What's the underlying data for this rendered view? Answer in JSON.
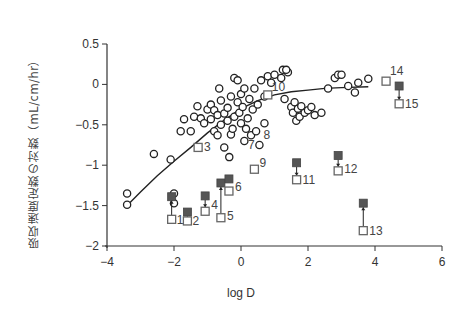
{
  "chart_data": {
    "type": "scatter",
    "title": "",
    "xlabel": "log D",
    "ylabel": "吸収速度定数の対数（mL/cm/hr）",
    "xlim": [
      -4,
      6
    ],
    "ylim": [
      -2,
      0.5
    ],
    "xticks": [
      "−4",
      "−2",
      "0",
      "2",
      "4",
      "6"
    ],
    "xtick_values": [
      -4,
      -2,
      0,
      2,
      4,
      6
    ],
    "yticks": [
      "0.5",
      "0",
      "−0.5",
      "−1",
      "−1.5",
      "−2"
    ],
    "ytick_values": [
      0.5,
      0,
      -0.5,
      -1,
      -1.5,
      -2
    ],
    "grid": false,
    "legend": null,
    "series": [
      {
        "name": "fitted curve",
        "style": "line",
        "points": [
          [
            -3.4,
            -1.5
          ],
          [
            -3.0,
            -1.33
          ],
          [
            -2.5,
            -1.13
          ],
          [
            -2.0,
            -0.95
          ],
          [
            -1.5,
            -0.78
          ],
          [
            -1.0,
            -0.6
          ],
          [
            -0.5,
            -0.44
          ],
          [
            0.0,
            -0.3
          ],
          [
            0.5,
            -0.2
          ],
          [
            1.0,
            -0.13
          ],
          [
            1.5,
            -0.09
          ],
          [
            2.0,
            -0.07
          ],
          [
            2.5,
            -0.05
          ],
          [
            3.0,
            -0.04
          ],
          [
            3.8,
            -0.03
          ]
        ]
      },
      {
        "name": "reference compounds",
        "style": "open-circle",
        "points": [
          [
            -3.4,
            -1.35
          ],
          [
            -3.4,
            -1.49
          ],
          [
            -2.6,
            -0.86
          ],
          [
            -2.1,
            -0.93
          ],
          [
            -1.8,
            -0.58
          ],
          [
            -1.7,
            -0.43
          ],
          [
            -1.5,
            -0.58
          ],
          [
            -1.4,
            -0.4
          ],
          [
            -1.3,
            -0.27
          ],
          [
            -1.2,
            -0.42
          ],
          [
            -1.1,
            -0.48
          ],
          [
            -1.0,
            -0.31
          ],
          [
            -0.9,
            -0.43
          ],
          [
            -0.9,
            -0.25
          ],
          [
            -0.8,
            -0.32
          ],
          [
            -0.8,
            -0.58
          ],
          [
            -0.7,
            -0.63
          ],
          [
            -0.7,
            -0.38
          ],
          [
            -0.6,
            -0.2
          ],
          [
            -0.6,
            -0.5
          ],
          [
            -0.5,
            -0.36
          ],
          [
            -0.5,
            -0.78
          ],
          [
            -0.4,
            -0.45
          ],
          [
            -0.4,
            -0.29
          ],
          [
            -0.3,
            -0.62
          ],
          [
            -0.3,
            -0.15
          ],
          [
            -0.25,
            -0.55
          ],
          [
            -0.2,
            -0.4
          ],
          [
            -0.2,
            0.08
          ],
          [
            -0.1,
            0.05
          ],
          [
            -0.1,
            -0.22
          ],
          [
            -0.05,
            -0.35
          ],
          [
            0.0,
            -0.48
          ],
          [
            0.0,
            -0.12
          ],
          [
            0.05,
            -0.28
          ],
          [
            0.1,
            -0.7
          ],
          [
            0.15,
            -0.55
          ],
          [
            0.2,
            -0.42
          ],
          [
            0.25,
            -0.18
          ],
          [
            0.3,
            -0.63
          ],
          [
            0.35,
            -0.31
          ],
          [
            0.4,
            -0.05
          ],
          [
            0.45,
            -0.58
          ],
          [
            0.5,
            -0.25
          ],
          [
            0.55,
            -0.75
          ],
          [
            0.6,
            0.05
          ],
          [
            0.7,
            -0.48
          ],
          [
            0.8,
            0.1
          ],
          [
            0.9,
            0.02
          ],
          [
            1.0,
            0.12
          ],
          [
            1.2,
            0.08
          ],
          [
            1.3,
            -0.18
          ],
          [
            1.4,
            0.15
          ],
          [
            1.5,
            -0.28
          ],
          [
            1.55,
            -0.35
          ],
          [
            1.6,
            -0.22
          ],
          [
            1.65,
            -0.45
          ],
          [
            1.7,
            -0.3
          ],
          [
            1.75,
            -0.4
          ],
          [
            1.8,
            -0.27
          ],
          [
            1.9,
            -0.35
          ],
          [
            2.0,
            -0.32
          ],
          [
            2.1,
            -0.28
          ],
          [
            2.2,
            -0.38
          ],
          [
            2.4,
            -0.35
          ],
          [
            2.6,
            -0.05
          ],
          [
            2.8,
            0.08
          ],
          [
            2.9,
            0.12
          ],
          [
            3.0,
            0.12
          ],
          [
            3.2,
            -0.02
          ],
          [
            3.4,
            -0.1
          ],
          [
            3.5,
            0.02
          ],
          [
            3.8,
            0.07
          ],
          [
            -0.35,
            -0.9
          ],
          [
            0.1,
            -0.05
          ],
          [
            -0.65,
            -0.05
          ],
          [
            0.7,
            -0.15
          ],
          [
            1.25,
            0.18
          ],
          [
            1.35,
            0.18
          ],
          [
            -2.0,
            -1.35
          ],
          [
            -2.0,
            -1.47
          ]
        ]
      },
      {
        "name": "test compounds (open = without enhancer)",
        "style": "open-square",
        "points": [
          {
            "id": "1",
            "x": -2.07,
            "y": -1.67
          },
          {
            "id": "2",
            "x": -1.6,
            "y": -1.69
          },
          {
            "id": "3",
            "x": -1.28,
            "y": -0.78
          },
          {
            "id": "4",
            "x": -1.07,
            "y": -1.57
          },
          {
            "id": "5",
            "x": -0.6,
            "y": -1.65
          },
          {
            "id": "6",
            "x": -0.36,
            "y": -1.32
          },
          {
            "id": "9",
            "x": 0.4,
            "y": -1.05
          },
          {
            "id": "10",
            "x": 0.8,
            "y": -0.13
          },
          {
            "id": "11",
            "x": 1.66,
            "y": -1.18
          },
          {
            "id": "12",
            "x": 2.9,
            "y": -1.07
          },
          {
            "id": "13",
            "x": 3.65,
            "y": -1.81
          },
          {
            "id": "14",
            "x": 4.33,
            "y": 0.04
          },
          {
            "id": "15",
            "x": 4.72,
            "y": -0.24
          }
        ]
      },
      {
        "name": "test compounds (filled = with enhancer)",
        "style": "filled-square",
        "points": [
          {
            "id": "1",
            "x": -2.07,
            "y": -1.39
          },
          {
            "id": "2",
            "x": -1.6,
            "y": -1.58
          },
          {
            "id": "4",
            "x": -1.07,
            "y": -1.38
          },
          {
            "id": "5",
            "x": -0.6,
            "y": -1.22
          },
          {
            "id": "6",
            "x": -0.36,
            "y": -1.17
          },
          {
            "id": "11",
            "x": 1.66,
            "y": -0.97
          },
          {
            "id": "12",
            "x": 2.9,
            "y": -0.88
          },
          {
            "id": "13",
            "x": 3.65,
            "y": -1.47
          },
          {
            "id": "15",
            "x": 4.72,
            "y": -0.02
          }
        ]
      }
    ],
    "annotations": [
      {
        "text": "1",
        "x": -2.07,
        "y": -1.67
      },
      {
        "text": "2",
        "x": -1.6,
        "y": -1.69
      },
      {
        "text": "3",
        "x": -1.28,
        "y": -0.78
      },
      {
        "text": "4",
        "x": -1.07,
        "y": -1.57
      },
      {
        "text": "5",
        "x": -0.6,
        "y": -1.65
      },
      {
        "text": "6",
        "x": -0.36,
        "y": -1.32
      },
      {
        "text": "7",
        "x": 0.15,
        "y": -0.7
      },
      {
        "text": "8",
        "x": 0.55,
        "y": -0.58
      },
      {
        "text": "9",
        "x": 0.4,
        "y": -1.05
      },
      {
        "text": "10",
        "x": 0.8,
        "y": -0.13
      },
      {
        "text": "11",
        "x": 1.66,
        "y": -1.18
      },
      {
        "text": "12",
        "x": 2.9,
        "y": -1.07
      },
      {
        "text": "13",
        "x": 3.65,
        "y": -1.81
      },
      {
        "text": "14",
        "x": 4.33,
        "y": 0.04
      },
      {
        "text": "15",
        "x": 4.72,
        "y": -0.24
      }
    ],
    "arrows": [
      {
        "id": "1",
        "from": -1.67,
        "to": -1.39,
        "x": -2.07
      },
      {
        "id": "2",
        "from": -1.69,
        "to": -1.58,
        "x": -1.6
      },
      {
        "id": "4",
        "from": -1.38,
        "to": -1.57,
        "x": -1.07
      },
      {
        "id": "5",
        "from": -1.65,
        "to": -1.22,
        "x": -0.6
      },
      {
        "id": "11",
        "from": -0.97,
        "to": -1.18,
        "x": 1.66
      },
      {
        "id": "12",
        "from": -0.88,
        "to": -1.07,
        "x": 2.9
      },
      {
        "id": "13",
        "from": -1.81,
        "to": -1.47,
        "x": 3.65
      },
      {
        "id": "15",
        "from": -0.02,
        "to": -0.24,
        "x": 4.72
      }
    ]
  },
  "colors": {
    "axis": "#333333",
    "marker_stroke": "#222222",
    "square_stroke": "#666666",
    "filled_square": "#555555",
    "text": "#444444"
  }
}
